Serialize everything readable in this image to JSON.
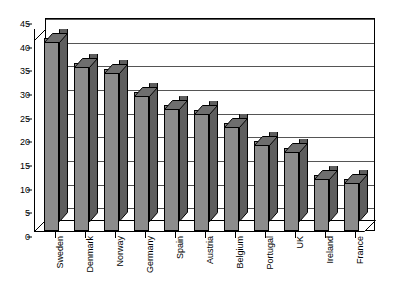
{
  "chart_data": {
    "type": "bar",
    "title": "",
    "subtitle": "",
    "xlabel": "",
    "ylabel": "",
    "ylim": [
      0,
      45
    ],
    "ytick_step": 5,
    "yticks": [
      "0",
      "5",
      "10",
      "15",
      "20",
      "25",
      "30",
      "35",
      "40",
      "45"
    ],
    "grid": true,
    "legend": false,
    "legend_position": "none",
    "style_note": "3D-effect vertical bars, grey fill, black outline, rotated category labels",
    "categories": [
      "Sweden",
      "Denmark",
      "Norway",
      "Germany",
      "Spain",
      "Austria",
      "Belgium",
      "Portugal",
      "UK",
      "Ireland",
      "France"
    ],
    "values": [
      43,
      37.5,
      36,
      31,
      28,
      27,
      24,
      20,
      18.5,
      12.5,
      11.5
    ],
    "series": [
      {
        "name": "",
        "values": [
          43,
          37.5,
          36,
          31,
          28,
          27,
          24,
          20,
          18.5,
          12.5,
          11.5
        ]
      }
    ],
    "colors": {
      "bar_fill": "#8c8c8c",
      "bar_side": "#5e5e5e",
      "bar_outline": "#000000",
      "gridline": "#555555",
      "axis": "#000000",
      "background": "#ffffff",
      "text": "#000000"
    }
  }
}
